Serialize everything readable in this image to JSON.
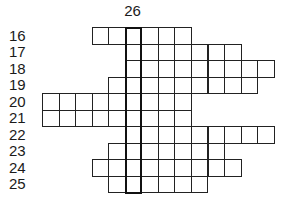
{
  "puzzle": {
    "column_label": "26",
    "highlight_column": 5,
    "grid": {
      "origin_x": 42,
      "origin_y": 27,
      "cell_size": 16.55
    },
    "rows": [
      {
        "label": "16",
        "start": 3,
        "end": 8
      },
      {
        "label": "17",
        "start": 5,
        "end": 11
      },
      {
        "label": "18",
        "start": 5,
        "end": 13
      },
      {
        "label": "19",
        "start": 4,
        "end": 12
      },
      {
        "label": "20",
        "start": 0,
        "end": 8
      },
      {
        "label": "21",
        "start": 0,
        "end": 8
      },
      {
        "label": "22",
        "start": 5,
        "end": 13
      },
      {
        "label": "23",
        "start": 4,
        "end": 10
      },
      {
        "label": "24",
        "start": 3,
        "end": 11
      },
      {
        "label": "25",
        "start": 4,
        "end": 9
      }
    ]
  }
}
